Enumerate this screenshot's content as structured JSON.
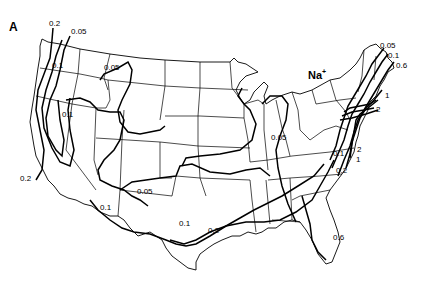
{
  "figure": {
    "panel_label": "A",
    "species": {
      "base": "Na",
      "charge": "+"
    }
  },
  "isopleth_labels": [
    {
      "id": "nw-0.2",
      "text": "0.2"
    },
    {
      "id": "nw-0.05",
      "text": "0.05"
    },
    {
      "id": "or-0.1",
      "text": "0.1"
    },
    {
      "id": "mt-0.05",
      "text": "0.05"
    },
    {
      "id": "nv-0.1",
      "text": "0.1"
    },
    {
      "id": "ca-0.2",
      "text": "0.2"
    },
    {
      "id": "az-0.1",
      "text": "0.1"
    },
    {
      "id": "nm-0.05",
      "text": "0.05"
    },
    {
      "id": "tx-0.1",
      "text": "0.1"
    },
    {
      "id": "tx-0.2",
      "text": "0.2"
    },
    {
      "id": "in-0.05",
      "text": "0.05"
    },
    {
      "id": "va-0.1",
      "text": "0.1"
    },
    {
      "id": "nc-0.2",
      "text": "0.2"
    },
    {
      "id": "ga-0.6",
      "text": "0.6"
    },
    {
      "id": "ne-0.05",
      "text": "0.05"
    },
    {
      "id": "ne-0.1",
      "text": "0.1"
    },
    {
      "id": "ne-0.6",
      "text": "0.6"
    },
    {
      "id": "ne-1",
      "text": "1"
    },
    {
      "id": "ne-2",
      "text": "2"
    },
    {
      "id": "md-2",
      "text": "2"
    },
    {
      "id": "md-1",
      "text": "1"
    }
  ],
  "isopleth_levels": [
    "0.05",
    "0.1",
    "0.2",
    "0.6",
    "1",
    "2"
  ]
}
